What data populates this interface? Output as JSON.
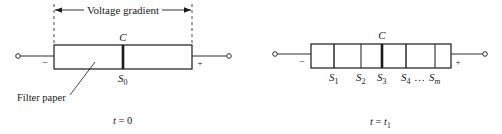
{
  "diagram": {
    "colors": {
      "ink": "#1a1a1a",
      "background": "#ffffff"
    },
    "left_panel": {
      "gradient_label": "Voltage gradient",
      "center_label": "C",
      "sample_label": "S",
      "sample_sub": "0",
      "minus_label": "−",
      "plus_label": "+",
      "paper_label": "Filter paper",
      "caption_t": "t",
      "caption_rest": " = 0"
    },
    "right_panel": {
      "center_label": "C",
      "minus_label": "−",
      "plus_label": "+",
      "segments": [
        {
          "label": "S",
          "sub": "1"
        },
        {
          "label": "S",
          "sub": "2"
        },
        {
          "label": "S",
          "sub": "3"
        },
        {
          "label": "S",
          "sub": "4"
        },
        {
          "label": "S",
          "sub": "m"
        }
      ],
      "ellipsis": "…",
      "caption_t": "t",
      "caption_eq": " = ",
      "caption_t2": "t",
      "caption_sub": "1"
    }
  }
}
